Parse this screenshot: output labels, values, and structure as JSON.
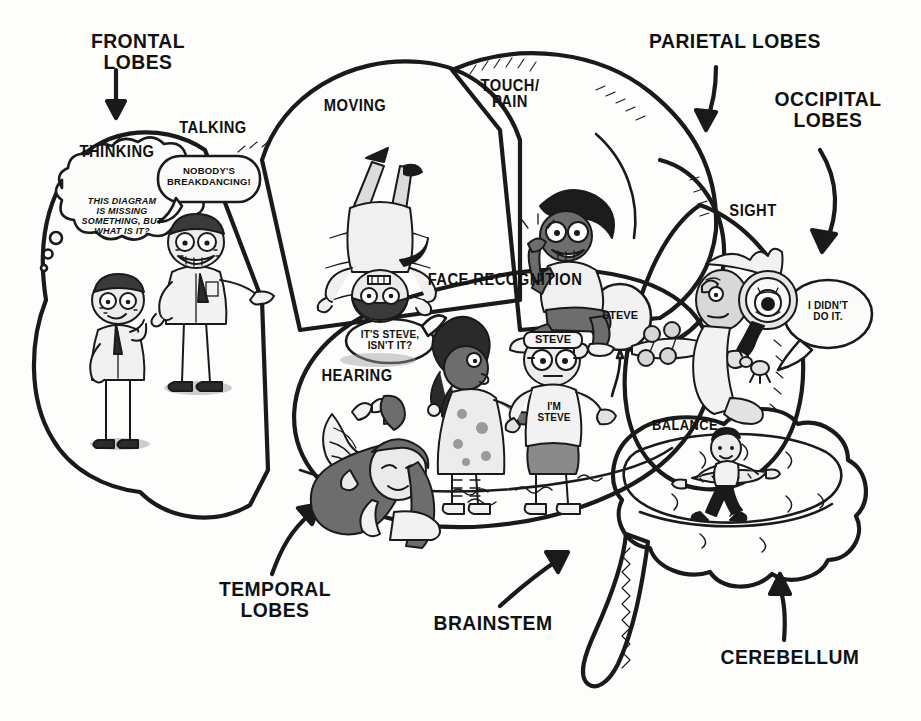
{
  "background_color": "#fdfdfc",
  "palette": {
    "ink": "#1a1a1a",
    "frontal_fill": "#c9c9c9",
    "motor_fill": "#c4c4c4",
    "parietal_fill": "#fbfbfa",
    "occipital_fill": "#8f8f8f",
    "temporal_fill": "#bfbfbf",
    "cerebellum_fill": "#6f6f6f",
    "brainstem_fill": "#fbfbfa",
    "skin": "#e8e8e8",
    "dark_skin": "#6d6d6d"
  },
  "outer_labels": [
    {
      "id": "frontal",
      "text": "FRONTAL LOBES"
    },
    {
      "id": "parietal",
      "text": "PARIETAL LOBES"
    },
    {
      "id": "occipital",
      "text": "OCCIPITAL\nLOBES"
    },
    {
      "id": "temporal",
      "text": "TEMPORAL\nLOBES"
    },
    {
      "id": "brainstem",
      "text": "BRAINSTEM"
    },
    {
      "id": "cerebellum",
      "text": "CEREBELLUM"
    }
  ],
  "inner_labels": [
    {
      "id": "thinking",
      "text": "THINKING"
    },
    {
      "id": "talking",
      "text": "TALKING"
    },
    {
      "id": "moving",
      "text": "MOVING"
    },
    {
      "id": "touchpain",
      "text": "TOUCH/\nPAIN"
    },
    {
      "id": "sight",
      "text": "SIGHT"
    },
    {
      "id": "face",
      "text": "FACE RECOGNITION"
    },
    {
      "id": "hearing",
      "text": "HEARING"
    },
    {
      "id": "balance",
      "text": "BALANCE"
    }
  ],
  "bubbles": [
    {
      "id": "thinking-thought",
      "kind": "thought",
      "text": "THIS DIAGRAM\nIS MISSING\nSOMETHING, BUT\nWHAT IS IT?"
    },
    {
      "id": "talking-speech",
      "kind": "speech",
      "text": "NOBODY'S\nBREAKDANCING!"
    },
    {
      "id": "girl-speech",
      "kind": "speech",
      "text": "IT'S STEVE,\nISN'T IT?"
    },
    {
      "id": "detective-speech",
      "kind": "speech",
      "text": "I DIDN'T\nDO IT."
    }
  ],
  "figure_text": [
    {
      "id": "headband",
      "text": "STEVE"
    },
    {
      "id": "tshirt",
      "text": "I'M\nSTEVE"
    },
    {
      "id": "balloon",
      "text": "STEVE"
    }
  ]
}
